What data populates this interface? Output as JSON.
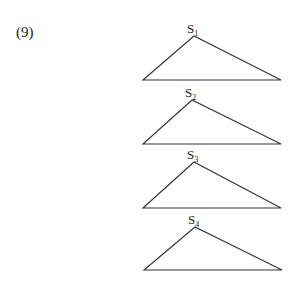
{
  "problem": {
    "number": "(9)"
  },
  "triangles": [
    {
      "label": "S",
      "sub": "1",
      "apex": [
        194,
        36
      ],
      "left": [
        143,
        80
      ],
      "right": [
        281,
        80
      ]
    },
    {
      "label": "S",
      "sub": "2",
      "apex": [
        192,
        100
      ],
      "left": [
        143,
        144
      ],
      "right": [
        281,
        144
      ]
    },
    {
      "label": "S",
      "sub": "3",
      "apex": [
        194,
        162
      ],
      "left": [
        143,
        208
      ],
      "right": [
        281,
        208
      ]
    },
    {
      "label": "S",
      "sub": "4",
      "apex": [
        195,
        227
      ],
      "left": [
        144,
        270
      ],
      "right": [
        282,
        270
      ]
    }
  ],
  "colors": {
    "stroke": "#333333",
    "text": "#222222",
    "background": "#ffffff"
  }
}
